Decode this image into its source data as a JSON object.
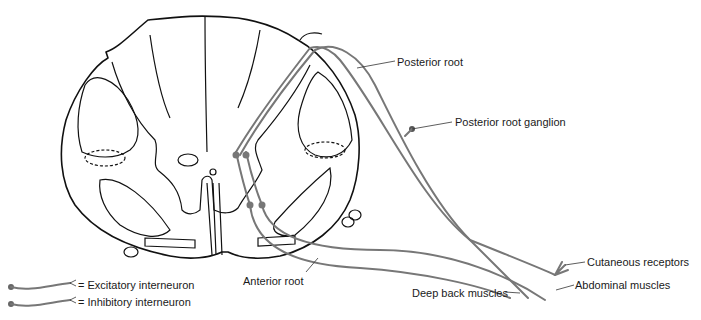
{
  "diagram": {
    "type": "anatomical",
    "colors": {
      "outline": "#111111",
      "nerve_fiber": "#777777",
      "label_text": "#1a1a1a",
      "background": "#ffffff"
    },
    "labels": {
      "posterior_root": "Posterior root",
      "posterior_root_ganglion": "Posterior root ganglion",
      "cutaneous_receptors": "Cutaneous receptors",
      "abdominal_muscles": "Abdominal muscles",
      "deep_back_muscles": "Deep back muscles",
      "anterior_root": "Anterior root"
    },
    "legend": [
      {
        "symbol": "neuron-excitatory",
        "label": "= Excitatory interneuron"
      },
      {
        "symbol": "neuron-inhibitory",
        "label": "= Inhibitory interneuron"
      }
    ]
  }
}
